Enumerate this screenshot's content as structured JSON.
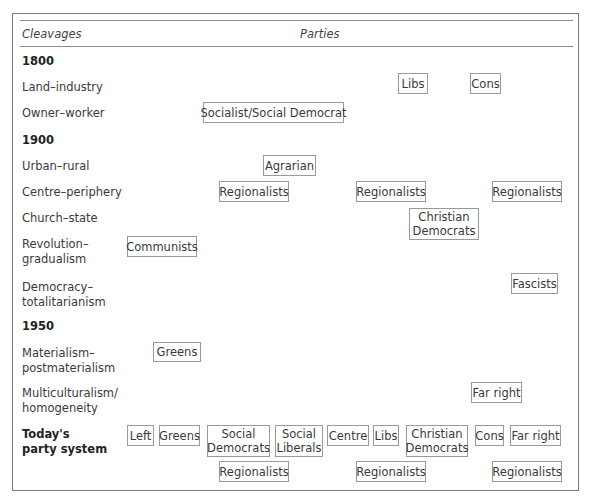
{
  "header": {
    "left": "Cleavages",
    "right": "Parties"
  },
  "years": {
    "y1800": "1800",
    "y1900": "1900",
    "y1950": "1950"
  },
  "cleavages": {
    "land_industry": "Land–industry",
    "owner_worker": "Owner–worker",
    "urban_rural": "Urban–rural",
    "centre_periphery": "Centre–periphery",
    "church_state": "Church–state",
    "revolution_gradualism": [
      "Revolution–",
      "gradualism"
    ],
    "democracy_totalitarianism": [
      "Democracy–",
      "totalitarianism"
    ],
    "materialism_postmaterialism": [
      "Materialism–",
      "postmaterialism"
    ],
    "multiculturalism_homogeneity": [
      "Multiculturalism/",
      "homogeneity"
    ],
    "today": [
      "Today's",
      "party system"
    ]
  },
  "parties": {
    "libs": "Libs",
    "cons": "Cons",
    "socialist": "Socialist/Social Democrat",
    "agrarian": "Agrarian",
    "regionalists": "Regionalists",
    "christian_democrats": [
      "Christian",
      "Democrats"
    ],
    "communists": "Communists",
    "fascists": "Fascists",
    "greens": "Greens",
    "far_right": "Far right"
  },
  "today": {
    "left": "Left",
    "greens": "Greens",
    "social_democrats": [
      "Social",
      "Democrats"
    ],
    "social_liberals": [
      "Social",
      "Liberals"
    ],
    "centre": "Centre",
    "libs": "Libs",
    "christian_democrats": [
      "Christian",
      "Democrats"
    ],
    "cons": "Cons",
    "far_right": "Far right",
    "regionalists": "Regionalists"
  }
}
